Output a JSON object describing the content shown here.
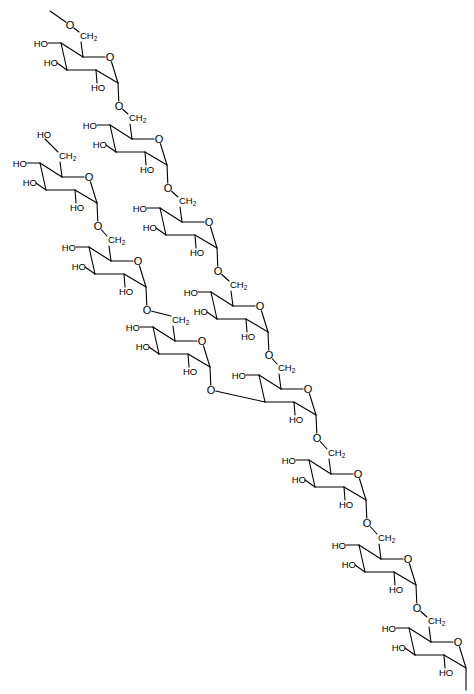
{
  "diagram": {
    "type": "chemical-structure",
    "colors": {
      "background": "#ffffff",
      "stroke": "#000000"
    },
    "labels": {
      "hydroxyl": "HO",
      "methylene": "CH",
      "methylene_sub": "2",
      "oxygen": "O"
    },
    "ring_template": {
      "C4": [
        0,
        0
      ],
      "C5": [
        22,
        14
      ],
      "O": [
        49,
        14
      ],
      "C1": [
        57,
        40
      ],
      "C2": [
        35,
        27
      ],
      "C3": [
        6,
        27
      ]
    },
    "rings": [
      {
        "id": "main-1",
        "c4": [
          61,
          43
        ],
        "c3_hydroxyl": true,
        "c6_substituent": "O-chain-start",
        "c1_link": "main-2"
      },
      {
        "id": "main-2",
        "c4": [
          110,
          125
        ],
        "c3_hydroxyl": true,
        "c6_substituent": "O-link",
        "c1_link": "main-3"
      },
      {
        "id": "main-3",
        "c4": [
          160,
          208
        ],
        "c3_hydroxyl": true,
        "c6_substituent": "O-link",
        "c1_link": "main-4"
      },
      {
        "id": "main-4",
        "c4": [
          211,
          292
        ],
        "c3_hydroxyl": true,
        "c6_substituent": "O-link",
        "c1_link": "main-5"
      },
      {
        "id": "main-5",
        "c4": [
          259,
          375
        ],
        "c3_hydroxyl": false,
        "c3_branch_from": "branch-3",
        "c6_substituent": "O-link",
        "c1_link": "main-6"
      },
      {
        "id": "main-6",
        "c4": [
          309,
          460
        ],
        "c3_hydroxyl": true,
        "c6_substituent": "O-link",
        "c1_link": "main-7"
      },
      {
        "id": "main-7",
        "c4": [
          359,
          545
        ],
        "c3_hydroxyl": true,
        "c6_substituent": "O-link",
        "c1_link": "main-8"
      },
      {
        "id": "main-8",
        "c4": [
          409,
          628
        ],
        "c3_hydroxyl": true,
        "c6_substituent": "O-link",
        "c1_link": "chain-end"
      },
      {
        "id": "branch-1",
        "c4": [
          40,
          163
        ],
        "c3_hydroxyl": true,
        "c6_substituent": "HO",
        "c1_link": "branch-2"
      },
      {
        "id": "branch-2",
        "c4": [
          89,
          247
        ],
        "c3_hydroxyl": true,
        "c6_substituent": "O-link",
        "c1_link": "branch-3"
      },
      {
        "id": "branch-3",
        "c4": [
          153,
          327
        ],
        "c3_hydroxyl": true,
        "c6_substituent": "O-link",
        "c1_link": "main-5-C3"
      }
    ]
  }
}
